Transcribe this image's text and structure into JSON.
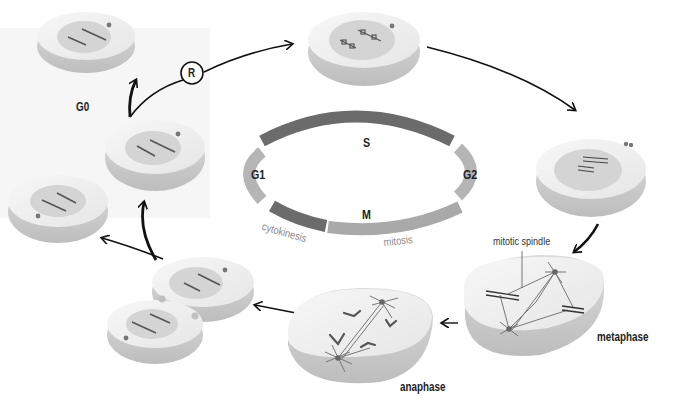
{
  "diagram": {
    "cycle": {
      "labels": {
        "s": "S",
        "g1": "G1",
        "g2": "G2",
        "m": "M"
      },
      "sublabels": {
        "cytokinesis": "cytokinesis",
        "mitosis": "mitosis"
      },
      "colors": {
        "s": "#6b6b6b",
        "g1": "#b5b5b5",
        "g2": "#b5b5b5",
        "cytokinesis": "#6b6b6b",
        "mitosis": "#a9a9a9"
      }
    },
    "stages": {
      "g0": "G0",
      "restriction_point": "R",
      "metaphase": "metaphase",
      "anaphase": "anaphase"
    },
    "annotations": {
      "mitotic_spindle": "mitotic spindle"
    },
    "colors": {
      "cell_top": "#ececec",
      "cell_side": "#c9c9c9",
      "nucleus": "#d4d4d4",
      "chromosome": "#555555",
      "arrow": "#111111"
    }
  }
}
